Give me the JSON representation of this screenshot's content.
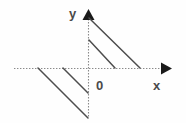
{
  "figure": {
    "kind": "cartesian-coordinate-diagram",
    "width": 186,
    "height": 123,
    "background_color": "#fefefe",
    "labels": {
      "y_axis": "y",
      "x_axis": "x",
      "origin": "0"
    },
    "colors": {
      "axis": "#808080",
      "axis_arrow": "#1a1a1a",
      "line": "#4d4d4d",
      "label_text": "#4a4a4a"
    }
  },
  "chart_data": {
    "type": "line",
    "title": "",
    "subtitle": "",
    "xlabel": "x",
    "ylabel": "y",
    "origin_label": "0",
    "grid": false,
    "legend": null,
    "axes": {
      "x_axis": {
        "label": "x",
        "style": "dotted",
        "color": "#808080",
        "arrow": "right",
        "pixel_y": 68,
        "pixel_x_start": 14,
        "pixel_x_end": 172,
        "tick_labels": []
      },
      "y_axis": {
        "label": "y",
        "style": "dotted",
        "color": "#808080",
        "arrow": "up",
        "pixel_x": 88,
        "pixel_y_start": 12,
        "pixel_y_end": 118,
        "tick_labels": []
      },
      "origin": {
        "pixel_x": 88,
        "pixel_y": 68
      }
    },
    "series": [
      {
        "name": "upper-right-long-segment",
        "quadrant": "I",
        "slope": -1,
        "color": "#4d4d4d",
        "points_px": [
          [
            89,
            18
          ],
          [
            140,
            68
          ]
        ]
      },
      {
        "name": "upper-right-short-segment",
        "quadrant": "I",
        "slope": -1,
        "color": "#4d4d4d",
        "points_px": [
          [
            89,
            40
          ],
          [
            115,
            68
          ]
        ]
      },
      {
        "name": "lower-left-long-segment",
        "quadrant": "III",
        "slope": -1,
        "color": "#4d4d4d",
        "points_px": [
          [
            38,
            68
          ],
          [
            88,
            118
          ]
        ]
      },
      {
        "name": "lower-left-short-segment",
        "quadrant": "III",
        "slope": -1,
        "color": "#4d4d4d",
        "points_px": [
          [
            63,
            68
          ],
          [
            88,
            93
          ]
        ]
      }
    ]
  }
}
